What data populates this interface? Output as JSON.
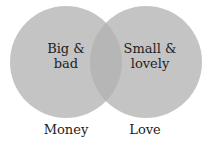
{
  "diagram": {
    "type": "venn",
    "colors": {
      "circle": "#c4c4c4",
      "overlap": "#b6b6b6",
      "text": "#222222"
    },
    "sets": [
      {
        "label": "Money",
        "region_text_line1": "Big &",
        "region_text_line2": "bad"
      },
      {
        "label": "Love",
        "region_text_line1": "Small &",
        "region_text_line2": "lovely"
      }
    ]
  }
}
